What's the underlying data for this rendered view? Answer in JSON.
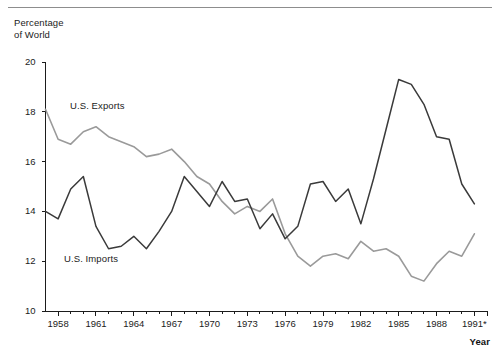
{
  "figure": {
    "y_axis_title": "Percentage\nof World",
    "x_axis_title": "Year"
  },
  "chart_data": {
    "type": "line",
    "title": "",
    "subtitle": "",
    "xlabel": "Year",
    "ylabel": "Percentage of World",
    "xlim": [
      1957,
      1992
    ],
    "ylim": [
      10,
      20
    ],
    "yticks": [
      10,
      12,
      14,
      16,
      18,
      20
    ],
    "ytick_labels": [
      "10",
      "12",
      "14",
      "16",
      "18",
      "20"
    ],
    "xticks": [
      1958,
      1961,
      1964,
      1967,
      1970,
      1973,
      1976,
      1979,
      1982,
      1985,
      1988,
      1991
    ],
    "xtick_labels": [
      "1958",
      "1961",
      "1964",
      "1967",
      "1970",
      "1973",
      "1976",
      "1979",
      "1982",
      "1985",
      "1988",
      "1991*"
    ],
    "minor_xticks_every": 1,
    "grid": false,
    "legend": "inline-annotations",
    "annotations": [
      {
        "text": "U.S. Exports",
        "near_year": 1961,
        "near_value": 17.5
      },
      {
        "text": "U.S. Imports",
        "near_year": 1961,
        "near_value": 11.9
      }
    ],
    "x": [
      1957,
      1958,
      1959,
      1960,
      1961,
      1962,
      1963,
      1964,
      1965,
      1966,
      1967,
      1968,
      1969,
      1970,
      1971,
      1972,
      1973,
      1974,
      1975,
      1976,
      1977,
      1978,
      1979,
      1980,
      1981,
      1982,
      1983,
      1984,
      1985,
      1986,
      1987,
      1988,
      1989,
      1990,
      1991
    ],
    "series": [
      {
        "name": "U.S. Exports",
        "color": "#9a9a9a",
        "values": [
          18.1,
          16.9,
          16.7,
          17.2,
          17.4,
          17.0,
          16.8,
          16.6,
          16.2,
          16.3,
          16.5,
          16.0,
          15.4,
          15.1,
          14.4,
          13.9,
          14.2,
          14.0,
          14.5,
          13.1,
          12.2,
          11.8,
          12.2,
          12.3,
          12.1,
          12.8,
          12.4,
          12.5,
          12.2,
          11.4,
          11.2,
          11.9,
          12.4,
          12.2,
          13.1
        ]
      },
      {
        "name": "U.S. Imports",
        "color": "#3a3a3a",
        "values": [
          14.0,
          13.7,
          14.9,
          15.4,
          13.4,
          12.5,
          12.6,
          13.0,
          12.5,
          13.2,
          14.0,
          15.4,
          14.8,
          14.2,
          15.2,
          14.4,
          14.5,
          13.3,
          13.9,
          12.9,
          13.4,
          15.1,
          15.2,
          14.4,
          14.9,
          13.5,
          15.3,
          17.3,
          19.3,
          19.1,
          18.3,
          17.0,
          16.9,
          15.1,
          14.3
        ],
        "values_note": "right-end rises slightly to 15.0 at 1991"
      }
    ]
  }
}
